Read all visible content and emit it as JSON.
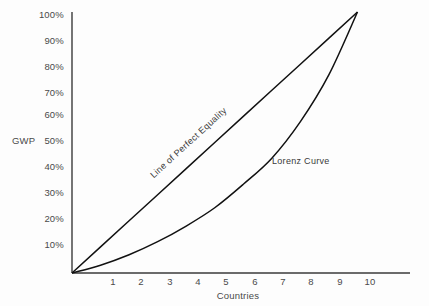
{
  "chart_data": {
    "type": "line",
    "title": "",
    "xlabel": "Countries",
    "ylabel": "GWP",
    "xlim": [
      0,
      10
    ],
    "ylim": [
      0,
      100
    ],
    "grid": false,
    "legend_position": "inline-annotations",
    "x_tick_labels": [
      "1",
      "2",
      "3",
      "4",
      "5",
      "6",
      "7",
      "8",
      "9",
      "10"
    ],
    "x_tick_values": [
      1,
      2,
      3,
      4,
      5,
      6,
      7,
      8,
      9,
      10
    ],
    "y_tick_labels": [
      "10%",
      "20%",
      "30%",
      "40%",
      "50%",
      "60%",
      "70%",
      "80%",
      "90%",
      "100%"
    ],
    "y_tick_values": [
      10,
      20,
      30,
      40,
      50,
      60,
      70,
      80,
      90,
      100
    ],
    "series": [
      {
        "name": "Line of Perfect Equality",
        "annotation": "Line of Perfect Equality",
        "x": [
          0,
          1,
          2,
          3,
          4,
          5,
          6,
          7,
          8,
          9,
          10
        ],
        "values": [
          0,
          10,
          20,
          30,
          40,
          50,
          60,
          70,
          80,
          90,
          100
        ]
      },
      {
        "name": "Lorenz Curve",
        "annotation": "Lorenz Curve",
        "x": [
          0,
          1,
          2,
          3,
          4,
          5,
          6,
          7,
          8,
          9,
          10
        ],
        "values": [
          0,
          3,
          7,
          12,
          18,
          25,
          34,
          44,
          58,
          76,
          100
        ]
      }
    ],
    "line_color": "#111111",
    "axis_color": "#3a3a3a",
    "background_color": "#fdfdfd"
  },
  "labels": {
    "y_axis_title": "GWP",
    "x_axis_title": "Countries",
    "equality_line": "Line of Perfect Equality",
    "lorenz_curve": "Lorenz Curve"
  }
}
